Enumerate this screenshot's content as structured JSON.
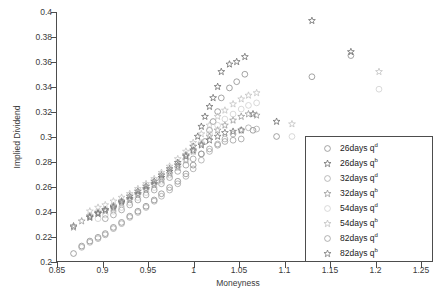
{
  "chart_data": {
    "type": "scatter",
    "title": "",
    "xlabel": "Moneyness",
    "ylabel": "Implied Dividend",
    "xlim": [
      0.85,
      1.25
    ],
    "ylim": [
      0.2,
      0.4
    ],
    "xticks": [
      "0.85",
      "0.9",
      "0.95",
      "1",
      "1.05",
      "1.1",
      "1.15",
      "1.2",
      "1.25"
    ],
    "xtick_values": [
      0.85,
      0.9,
      0.95,
      1.0,
      1.05,
      1.1,
      1.15,
      1.2,
      1.25
    ],
    "yticks": [
      "0.2",
      "0.22",
      "0.24",
      "0.26",
      "0.28",
      "0.3",
      "0.32",
      "0.34",
      "0.36",
      "0.38",
      "0.4"
    ],
    "ytick_values": [
      0.2,
      0.22,
      0.24,
      0.26,
      0.28,
      0.3,
      0.32,
      0.34,
      0.36,
      0.38,
      0.4
    ],
    "grid": false,
    "legend_position": "right",
    "series": [
      {
        "name": "26days q^d",
        "label_main": "26days q",
        "label_sup": "d",
        "marker": "circle",
        "color": "#8c8c8c",
        "points": [
          [
            0.868,
            0.206
          ],
          [
            0.877,
            0.212
          ],
          [
            0.886,
            0.216
          ],
          [
            0.895,
            0.219
          ],
          [
            0.903,
            0.222
          ],
          [
            0.912,
            0.227
          ],
          [
            0.921,
            0.231
          ],
          [
            0.93,
            0.236
          ],
          [
            0.939,
            0.24
          ],
          [
            0.948,
            0.244
          ],
          [
            0.957,
            0.249
          ],
          [
            0.965,
            0.254
          ],
          [
            0.974,
            0.259
          ],
          [
            0.983,
            0.264
          ],
          [
            0.992,
            0.27
          ],
          [
            1.0,
            0.277
          ],
          [
            1.009,
            0.286
          ],
          [
            1.013,
            0.296
          ],
          [
            1.018,
            0.305
          ],
          [
            1.022,
            0.312
          ],
          [
            1.027,
            0.32
          ],
          [
            1.031,
            0.331
          ],
          [
            1.04,
            0.339
          ],
          [
            1.048,
            0.344
          ],
          [
            1.057,
            0.35
          ],
          [
            1.066,
            0.305
          ],
          [
            1.092,
            0.3
          ],
          [
            1.131,
            0.348
          ],
          [
            1.174,
            0.365
          ]
        ]
      },
      {
        "name": "26days q^b",
        "label_main": "26days q",
        "label_sup": "b",
        "marker": "star",
        "color": "#6e6e6e",
        "points": [
          [
            0.868,
            0.228
          ],
          [
            0.886,
            0.236
          ],
          [
            0.895,
            0.239
          ],
          [
            0.903,
            0.241
          ],
          [
            0.912,
            0.243
          ],
          [
            0.921,
            0.247
          ],
          [
            0.93,
            0.25
          ],
          [
            0.939,
            0.254
          ],
          [
            0.948,
            0.258
          ],
          [
            0.957,
            0.262
          ],
          [
            0.965,
            0.267
          ],
          [
            0.974,
            0.272
          ],
          [
            0.983,
            0.277
          ],
          [
            0.992,
            0.285
          ],
          [
            1.0,
            0.292
          ],
          [
            1.005,
            0.3
          ],
          [
            1.009,
            0.308
          ],
          [
            1.013,
            0.316
          ],
          [
            1.018,
            0.324
          ],
          [
            1.022,
            0.331
          ],
          [
            1.027,
            0.34
          ],
          [
            1.031,
            0.352
          ],
          [
            1.04,
            0.358
          ],
          [
            1.048,
            0.36
          ],
          [
            1.057,
            0.364
          ],
          [
            1.066,
            0.318
          ],
          [
            1.092,
            0.312
          ],
          [
            1.131,
            0.393
          ],
          [
            1.174,
            0.368
          ]
        ]
      },
      {
        "name": "32days q^d",
        "label_main": "32days q",
        "label_sup": "d",
        "marker": "circle",
        "color": "#a8a8a8",
        "points": [
          [
            0.877,
            0.211
          ],
          [
            0.886,
            0.215
          ],
          [
            0.895,
            0.218
          ],
          [
            0.903,
            0.221
          ],
          [
            0.912,
            0.226
          ],
          [
            0.921,
            0.23
          ],
          [
            0.93,
            0.235
          ],
          [
            0.939,
            0.239
          ],
          [
            0.948,
            0.243
          ],
          [
            0.957,
            0.248
          ],
          [
            0.965,
            0.252
          ],
          [
            0.974,
            0.257
          ],
          [
            0.983,
            0.262
          ],
          [
            0.992,
            0.268
          ],
          [
            1.0,
            0.274
          ],
          [
            1.009,
            0.281
          ],
          [
            1.018,
            0.288
          ],
          [
            1.027,
            0.294
          ],
          [
            1.035,
            0.298
          ],
          [
            1.044,
            0.302
          ],
          [
            1.053,
            0.305
          ],
          [
            1.061,
            0.307
          ],
          [
            1.07,
            0.306
          ]
        ]
      },
      {
        "name": "32days q^b",
        "label_main": "32days q",
        "label_sup": "b",
        "marker": "star",
        "color": "#9a9a9a",
        "points": [
          [
            0.868,
            0.227
          ],
          [
            0.877,
            0.232
          ],
          [
            0.886,
            0.235
          ],
          [
            0.895,
            0.238
          ],
          [
            0.903,
            0.24
          ],
          [
            0.912,
            0.242
          ],
          [
            0.921,
            0.246
          ],
          [
            0.93,
            0.249
          ],
          [
            0.939,
            0.253
          ],
          [
            0.948,
            0.257
          ],
          [
            0.957,
            0.261
          ],
          [
            0.965,
            0.265
          ],
          [
            0.974,
            0.27
          ],
          [
            0.983,
            0.275
          ],
          [
            0.992,
            0.281
          ],
          [
            1.0,
            0.288
          ],
          [
            1.009,
            0.294
          ],
          [
            1.018,
            0.3
          ],
          [
            1.027,
            0.305
          ],
          [
            1.035,
            0.309
          ],
          [
            1.044,
            0.313
          ],
          [
            1.053,
            0.316
          ],
          [
            1.061,
            0.318
          ],
          [
            1.07,
            0.317
          ]
        ]
      },
      {
        "name": "54days q^d",
        "label_main": "54days q",
        "label_sup": "d",
        "marker": "circle",
        "color": "#cfcfcf",
        "points": [
          [
            0.895,
            0.234
          ],
          [
            0.903,
            0.237
          ],
          [
            0.912,
            0.24
          ],
          [
            0.921,
            0.243
          ],
          [
            0.93,
            0.247
          ],
          [
            0.939,
            0.251
          ],
          [
            0.948,
            0.255
          ],
          [
            0.957,
            0.259
          ],
          [
            0.965,
            0.264
          ],
          [
            0.974,
            0.269
          ],
          [
            0.983,
            0.275
          ],
          [
            0.992,
            0.281
          ],
          [
            1.0,
            0.288
          ],
          [
            1.009,
            0.295
          ],
          [
            1.018,
            0.302
          ],
          [
            1.027,
            0.309
          ],
          [
            1.035,
            0.314
          ],
          [
            1.044,
            0.318
          ],
          [
            1.053,
            0.322
          ],
          [
            1.061,
            0.325
          ],
          [
            1.07,
            0.327
          ],
          [
            1.109,
            0.3
          ],
          [
            1.205,
            0.338
          ]
        ]
      },
      {
        "name": "54days q^b",
        "label_main": "54days q",
        "label_sup": "b",
        "marker": "star",
        "color": "#c2c2c2",
        "points": [
          [
            0.886,
            0.24
          ],
          [
            0.895,
            0.243
          ],
          [
            0.903,
            0.245
          ],
          [
            0.912,
            0.248
          ],
          [
            0.921,
            0.251
          ],
          [
            0.93,
            0.254
          ],
          [
            0.939,
            0.258
          ],
          [
            0.948,
            0.262
          ],
          [
            0.957,
            0.266
          ],
          [
            0.965,
            0.271
          ],
          [
            0.974,
            0.276
          ],
          [
            0.983,
            0.282
          ],
          [
            0.992,
            0.288
          ],
          [
            1.0,
            0.295
          ],
          [
            1.009,
            0.302
          ],
          [
            1.018,
            0.309
          ],
          [
            1.027,
            0.316
          ],
          [
            1.035,
            0.321
          ],
          [
            1.044,
            0.326
          ],
          [
            1.053,
            0.33
          ],
          [
            1.061,
            0.333
          ],
          [
            1.07,
            0.335
          ],
          [
            1.109,
            0.31
          ],
          [
            1.205,
            0.352
          ]
        ]
      },
      {
        "name": "82days q^d",
        "label_main": "82days q",
        "label_sup": "d",
        "marker": "circle",
        "color": "#9c9c9c",
        "points": [
          [
            0.903,
            0.234
          ],
          [
            0.912,
            0.237
          ],
          [
            0.921,
            0.241
          ],
          [
            0.93,
            0.245
          ],
          [
            0.939,
            0.249
          ],
          [
            0.948,
            0.253
          ],
          [
            0.957,
            0.257
          ],
          [
            0.965,
            0.262
          ],
          [
            0.974,
            0.267
          ],
          [
            0.983,
            0.272
          ],
          [
            0.992,
            0.277
          ],
          [
            1.0,
            0.282
          ],
          [
            1.009,
            0.286
          ],
          [
            1.018,
            0.29
          ],
          [
            1.027,
            0.293
          ],
          [
            1.035,
            0.296
          ],
          [
            1.044,
            0.297
          ],
          [
            1.053,
            0.298
          ]
        ]
      },
      {
        "name": "82days q^b",
        "label_main": "82days q",
        "label_sup": "b",
        "marker": "star",
        "color": "#7a7a7a",
        "points": [
          [
            0.886,
            0.235
          ],
          [
            0.895,
            0.238
          ],
          [
            0.903,
            0.241
          ],
          [
            0.912,
            0.244
          ],
          [
            0.921,
            0.248
          ],
          [
            0.93,
            0.252
          ],
          [
            0.939,
            0.256
          ],
          [
            0.948,
            0.26
          ],
          [
            0.957,
            0.264
          ],
          [
            0.965,
            0.269
          ],
          [
            0.974,
            0.274
          ],
          [
            0.983,
            0.279
          ],
          [
            0.992,
            0.284
          ],
          [
            1.0,
            0.289
          ],
          [
            1.009,
            0.293
          ],
          [
            1.018,
            0.297
          ],
          [
            1.027,
            0.3
          ],
          [
            1.035,
            0.303
          ],
          [
            1.044,
            0.304
          ],
          [
            1.053,
            0.305
          ]
        ]
      }
    ]
  }
}
